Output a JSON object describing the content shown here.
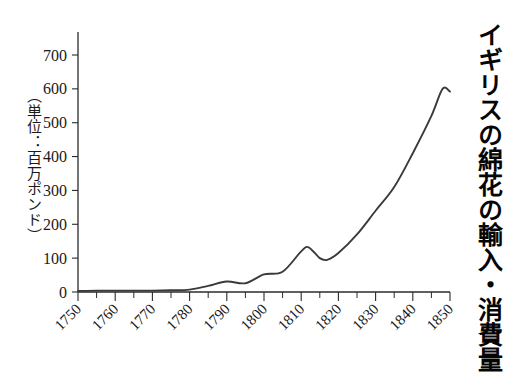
{
  "chart_data": {
    "type": "line",
    "title": "イギリスの綿花の輸入・消費量",
    "ylabel": "（単位：百万ポンド）",
    "xlabel": "",
    "xlim": [
      1748,
      1852
    ],
    "ylim": [
      0,
      750
    ],
    "grid": false,
    "legend": "none",
    "x_ticks_major": [
      1750,
      1760,
      1770,
      1780,
      1790,
      1800,
      1810,
      1820,
      1830,
      1840,
      1850
    ],
    "x_tick_labels": [
      "1750",
      "1760",
      "1770",
      "1780",
      "1790",
      "1800",
      "1810",
      "1820",
      "1830",
      "1840",
      "1850"
    ],
    "x_ticks_minor": [
      1755,
      1765,
      1775,
      1785,
      1795,
      1805,
      1815,
      1825,
      1835,
      1845
    ],
    "y_ticks": [
      0,
      100,
      200,
      300,
      400,
      500,
      600,
      700
    ],
    "y_tick_labels": [
      "0",
      "100",
      "200",
      "300",
      "400",
      "500",
      "600",
      "700"
    ],
    "series": [
      {
        "name": "イギリスの綿花の輸入・消費量",
        "color": "#3a3a3a",
        "x": [
          1750,
          1755,
          1760,
          1765,
          1770,
          1775,
          1780,
          1785,
          1790,
          1795,
          1800,
          1805,
          1810,
          1812,
          1815,
          1817,
          1820,
          1825,
          1830,
          1835,
          1840,
          1845,
          1848,
          1850
        ],
        "values": [
          3,
          4,
          4,
          4,
          4,
          5,
          7,
          18,
          31,
          26,
          52,
          60,
          120,
          132,
          100,
          95,
          115,
          170,
          240,
          310,
          410,
          520,
          600,
          592
        ]
      }
    ]
  }
}
